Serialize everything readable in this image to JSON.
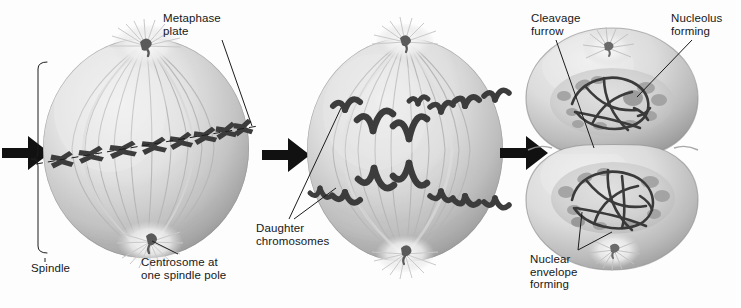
{
  "figure": {
    "background_color": "#fdfdfd",
    "ink_color": "#16181a",
    "cell_light": "#eeeeee",
    "cell_mid": "#c8c8c8",
    "cell_dark": "#979797",
    "chromosome_color": "#3a3a3a",
    "fiber_color": "#b4b4b4"
  },
  "labels": {
    "metaphase_plate": "Metaphase\nplate",
    "spindle": "Spindle",
    "centrosome": "Centrosome at\none spindle pole",
    "daughter_chromosomes": "Daughter\nchromosomes",
    "cleavage_furrow": "Cleavage\nfurrow",
    "nucleolus_forming": "Nucleolus\nforming",
    "nuclear_envelope_forming": "Nuclear\nenvelope\nforming"
  },
  "stages": [
    {
      "id": "metaphase",
      "name": "Metaphase cell",
      "chromosome_count": 8,
      "features": [
        "metaphase plate",
        "spindle",
        "centrosome at one spindle pole",
        "spindle fibers",
        "aster"
      ]
    },
    {
      "id": "anaphase",
      "name": "Anaphase cell",
      "chromosome_count": 16,
      "features": [
        "daughter chromosomes",
        "spindle fibers",
        "poles"
      ]
    },
    {
      "id": "telophase",
      "name": "Telophase / cytokinesis cell",
      "daughter_cells": 2,
      "features": [
        "cleavage furrow",
        "nucleolus forming",
        "nuclear envelope forming",
        "decondensing chromatin"
      ]
    }
  ],
  "arrows": [
    {
      "id": "arrow-1",
      "glyph": "right-arrow"
    },
    {
      "id": "arrow-2",
      "glyph": "right-arrow"
    },
    {
      "id": "arrow-3",
      "glyph": "right-arrow"
    }
  ]
}
